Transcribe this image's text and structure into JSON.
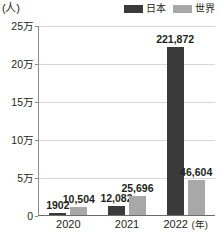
{
  "chart_data": {
    "type": "bar",
    "title": "",
    "subtitle": "",
    "unit_label": "(人)",
    "xlabel": "年",
    "ylabel": "",
    "categories": [
      "2020",
      "2021",
      "2022"
    ],
    "series": [
      {
        "name": "日本",
        "color": "#3a3a3a",
        "values": [
          1902,
          12082,
          221872
        ],
        "labels": [
          "1902",
          "12,082",
          "221,872"
        ]
      },
      {
        "name": "世界",
        "color": "#a8a8a8",
        "values": [
          10504,
          25696,
          46604
        ],
        "labels": [
          "10,504",
          "25,696",
          "46,604"
        ]
      }
    ],
    "ylim": [
      0,
      250000
    ],
    "yticks": [
      0,
      50000,
      100000,
      150000,
      200000,
      250000
    ],
    "ytick_labels": [
      "0",
      "5万",
      "10万",
      "15万",
      "20万",
      "25万"
    ],
    "grid": true,
    "legend_position": "top-right"
  },
  "legend": {
    "entries": [
      {
        "label": "日本",
        "color": "#3a3a3a"
      },
      {
        "label": "世界",
        "color": "#a8a8a8"
      }
    ]
  },
  "axis": {
    "unit": "(人)",
    "x_unit": "(年)"
  }
}
